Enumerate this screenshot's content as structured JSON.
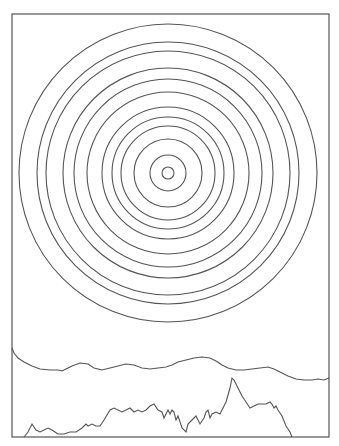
{
  "drawing": {
    "frame": {
      "x": 12,
      "y": 14,
      "width": 317,
      "height": 423
    },
    "stroke_color": "#555555",
    "background": "#ffffff",
    "concentric_circles": {
      "center": [
        168,
        173
      ],
      "radii": [
        6,
        18,
        34,
        47,
        56,
        66,
        81,
        94,
        105,
        122,
        131,
        149
      ]
    },
    "upper_ridge": "12,348 14,353 18,358 24,362 32,366 40,369 50,370 58,370 62,371 66,369 72,366 80,363 88,364 94,368 102,370 110,368 118,366 126,364 134,365 142,368 150,369 158,368 166,367 172,365 178,362 186,360 194,358 202,357 210,358 216,361 222,365 228,368 236,370 244,370 252,369 260,368 268,367 274,369 280,372 288,376 296,379 304,380 312,380 318,379 324,380 329,378",
    "lower_ridge": "24,437 28,432 32,424 36,430 40,432 44,430 48,428 52,430 58,434 64,434 70,432 76,432 82,428 86,424 88,426 92,424 96,426 100,426 104,420 110,410 114,408 118,410 122,412 126,410 130,408 134,412 138,410 142,412 146,410 150,406 154,404 158,410 162,412 164,418 168,410 170,414 172,410 174,412 176,420 178,416 182,428 186,432 188,424 192,420 196,416 200,424 204,418 206,412 208,410 210,418 212,414 216,412 220,414 222,410 226,402 230,388 232,378 234,380 238,388 242,396 246,402 250,408 254,406 258,404 262,404 266,404 270,402 272,404 274,408 276,406 278,410 282,416 286,426 290,432 292,437"
  }
}
